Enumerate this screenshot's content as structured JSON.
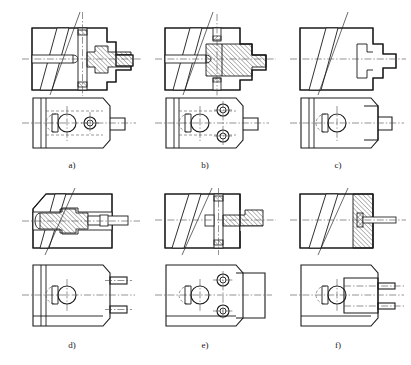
{
  "figure": {
    "type": "engineering-drawing",
    "background_color": "#ffffff",
    "line_color": "#1a1a1a",
    "hatch_color": "#1a1a1a",
    "centerline_color": "#4a4a4a",
    "panel_count": 6,
    "rows": 2,
    "columns": 3
  },
  "panels": [
    {
      "id": "a",
      "label": "a)",
      "label_x": 72,
      "label_y": 168,
      "views": [
        "sectional-elevation",
        "plan-view"
      ],
      "description": "Clamp body with vertical through pin and stepped plunger, plan view shows circular bore and pin boss"
    },
    {
      "id": "b",
      "label": "b)",
      "label_x": 205,
      "label_y": 168,
      "views": [
        "sectional-elevation",
        "plan-view"
      ],
      "description": "Clamp body with hatched block insert and two pins, plan view shows two ring bosses"
    },
    {
      "id": "c",
      "label": "c)",
      "label_x": 338,
      "label_y": 168,
      "views": [
        "sectional-elevation",
        "plan-view"
      ],
      "description": "Clamp body with integral stepped plunger, plan view plain with stepped spigot"
    },
    {
      "id": "d",
      "label": "d)",
      "label_x": 72,
      "label_y": 348,
      "views": [
        "sectional-elevation",
        "plan-view"
      ],
      "description": "Clamp body with axial plunger rod entering from right, plan view shows two side pins"
    },
    {
      "id": "e",
      "label": "e)",
      "label_x": 205,
      "label_y": 348,
      "views": [
        "sectional-elevation",
        "plan-view"
      ],
      "description": "Clamp body with vertical pin and side plunger, plan view shows two ring bosses"
    },
    {
      "id": "f",
      "label": "f)",
      "label_x": 338,
      "label_y": 348,
      "views": [
        "sectional-elevation",
        "plan-view"
      ],
      "description": "Clamp body with small axial pin, plan view shows applied plate with two pins"
    }
  ]
}
